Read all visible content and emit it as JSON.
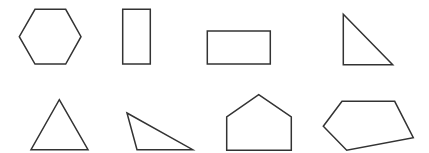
{
  "diagram": {
    "width": 429,
    "height": 153,
    "background": "#ffffff",
    "stroke_color": "#333333",
    "stroke_width": 1.5,
    "shapes": [
      {
        "id": "hexagon",
        "label": "regular hexagon",
        "points": "35,9.3 65.7,9.3 81,36.7 65.7,64 35,64 19.3,36.7"
      },
      {
        "id": "tall-rectangle",
        "label": "tall rectangle",
        "points": "122.7,9.3 150.3,9.3 150.3,64 122.7,64"
      },
      {
        "id": "wide-rectangle",
        "label": "wide rectangle",
        "points": "207.3,31 270.3,31 270.3,64 207.3,64"
      },
      {
        "id": "right-triangle",
        "label": "right triangle",
        "points": "343.3,14.3 392.7,64.7 343.3,64.7"
      },
      {
        "id": "isosceles-triangle",
        "label": "triangle",
        "points": "59.3,99.7 88,149.7 31,149.7"
      },
      {
        "id": "obtuse-triangle",
        "label": "obtuse scalene triangle",
        "points": "127,113 192.7,149.7 137,149.7"
      },
      {
        "id": "house-pentagon",
        "label": "house-shaped pentagon",
        "points": "258.7,94.7 291.3,117 291.3,150.3 226.7,150.3 226.7,117"
      },
      {
        "id": "irregular-pentagon",
        "label": "irregular pentagon",
        "points": "342,101.3 394.7,101.3 413.3,137.7 346.7,150.3 323.3,126.3"
      }
    ]
  }
}
